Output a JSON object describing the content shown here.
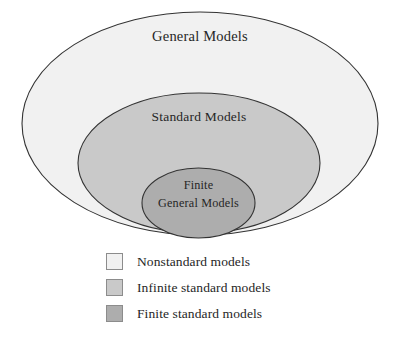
{
  "diagram": {
    "type": "nested-euler-diagram",
    "title": "",
    "regions": [
      {
        "id": "general-models",
        "label": "General Models",
        "fill": "#f1f1f1",
        "stroke": "#333333",
        "cx": 200,
        "cy": 123.5,
        "rx": 178,
        "ry": 111.5,
        "label_x": 200,
        "label_y": 41
      },
      {
        "id": "standard-models",
        "label": "Standard Models",
        "fill": "#c9c9c9",
        "stroke": "#333333",
        "cx": 199,
        "cy": 163,
        "rx": 121,
        "ry": 70,
        "label_x": 199,
        "label_y": 121
      },
      {
        "id": "finite-general-models",
        "label_line1": "Finite",
        "label_line2": "General Models",
        "fill": "#adadad",
        "stroke": "#333333",
        "cx": 198.5,
        "cy": 203,
        "rx": 56.5,
        "ry": 35,
        "label_x": 198.5,
        "label_y1": 189,
        "label_y2": 207
      }
    ]
  },
  "legend": {
    "items": [
      {
        "label": "Nonstandard models",
        "color": "#f1f1f1"
      },
      {
        "label": "Infinite standard models",
        "color": "#c9c9c9"
      },
      {
        "label": "Finite standard models",
        "color": "#adadad"
      }
    ]
  }
}
